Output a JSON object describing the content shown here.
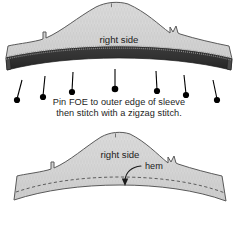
{
  "document": {
    "kind": "sewing-instruction-diagram",
    "background_color": "#ffffff",
    "width": 238,
    "height": 248
  },
  "palette": {
    "fabric_fill": "#d6d6d6",
    "fabric_fill_light": "#dddddd",
    "fabric_outline": "#555555",
    "foe_band_fill": "#333333",
    "foe_band_edge": "#1a1a1a",
    "pin_color": "#000000",
    "stitch_color": "#4a4a4a",
    "text_color": "#1c1c1c"
  },
  "figures": [
    {
      "id": "foe-figure",
      "fabric_label": "right side",
      "band_name": "FOE band",
      "stitch_type": "zigzag stitch",
      "pin_count": 7,
      "pins": [
        {
          "head_x": 17,
          "head_y": 100,
          "tip_x": 22,
          "tip_y": 80
        },
        {
          "head_x": 43,
          "head_y": 97,
          "tip_x": 45,
          "tip_y": 76
        },
        {
          "head_x": 72,
          "head_y": 92,
          "tip_x": 73,
          "tip_y": 72
        },
        {
          "head_x": 115,
          "head_y": 89,
          "tip_x": 115,
          "tip_y": 69
        },
        {
          "head_x": 157,
          "head_y": 91,
          "tip_x": 156,
          "tip_y": 71
        },
        {
          "head_x": 186,
          "head_y": 95,
          "tip_x": 184,
          "tip_y": 75
        },
        {
          "head_x": 217,
          "head_y": 100,
          "tip_x": 213,
          "tip_y": 80
        }
      ],
      "caption_lines": [
        "Pin FOE to outer edge of sleeve",
        "then stitch with a zigzag stitch."
      ]
    },
    {
      "id": "hem-figure",
      "fabric_label": "right side",
      "hem_label": "hem",
      "stitch_type": "narrow hem stitch",
      "stitch_style": "dashed",
      "caption_lines": [
        "If not using FOE, just stitch a narrow hem."
      ]
    }
  ],
  "pattern_marks": {
    "center_notch_label": "center notch",
    "left_notch_label": "single notch",
    "right_notch_label": "double notch"
  }
}
